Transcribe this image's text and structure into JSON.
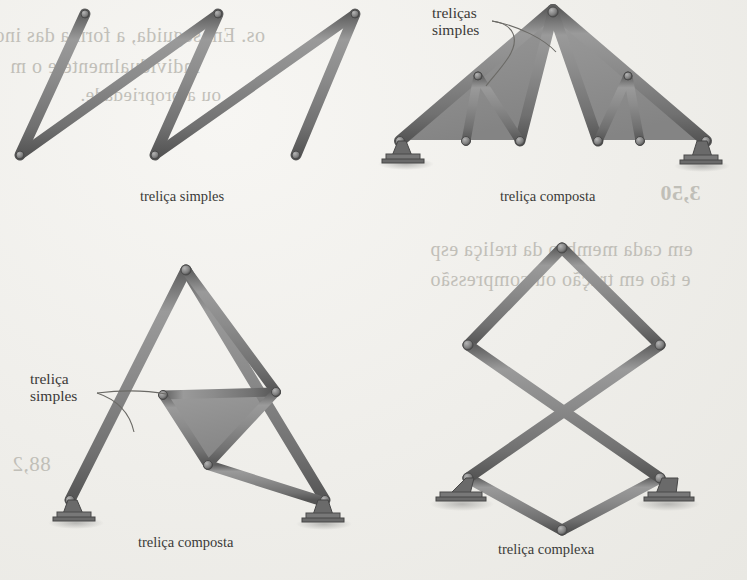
{
  "page": {
    "background_color": "#efeeea",
    "ink_color": "#3a3a38",
    "bar_color": "#8a8a8a",
    "bar_edge_color": "#5d5d5d",
    "panel_fill_color": "#8d8d8d",
    "support_color": "#6f6f6f",
    "bleed_text_color": "#b9b7b0"
  },
  "bleed_text": {
    "top_left_line1": "os. Em seguida, a forma das ino",
    "top_left_line2": "individualmente e o m",
    "top_left_line3": "ou a propriedade.",
    "top_right_line1": "3,50",
    "mid_right_line1": "em cada membro da treliça esp",
    "mid_right_line2": "e tão em tração ou compressão",
    "mid_left_line1": "88,2"
  },
  "figures": [
    {
      "id": "simple-truss",
      "caption": "treliça simples",
      "caption_x": 140,
      "caption_y": 188,
      "type": "simple",
      "description": "parallelogram outline with two diagonal web members forming four triangles"
    },
    {
      "id": "compound-truss-roof",
      "caption": "treliça composta",
      "caption_x": 500,
      "caption_y": 188,
      "type": "compound",
      "description": "symmetric roof truss, two shaded simple-truss panels flanking open central triangle",
      "leader_label": {
        "line1": "treliças",
        "line2": "simples",
        "x": 432,
        "y": 4
      }
    },
    {
      "id": "compound-truss-triangle",
      "caption": "treliça composta",
      "caption_x": 138,
      "caption_y": 534,
      "type": "compound",
      "description": "large triangle containing an inner shaded simple truss sub-assembly",
      "leader_label": {
        "line1": "treliça",
        "line2": "simples",
        "x": 30,
        "y": 370
      }
    },
    {
      "id": "complex-truss",
      "caption": "treliça complexa",
      "caption_x": 498,
      "caption_y": 541,
      "type": "complex",
      "description": "hexagonal frame with three long crossing diagonals meeting at the centre"
    }
  ],
  "supports": {
    "label": "pin support with bolted base plate",
    "count": 6
  }
}
